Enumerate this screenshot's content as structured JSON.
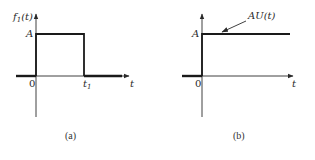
{
  "figure": {
    "panels": [
      {
        "id": "a",
        "caption": "(a)",
        "y_label_main": "f",
        "y_label_sub": "1",
        "y_label_arg": "(t)",
        "x_label": "t",
        "origin_label": "0",
        "amplitude_label": "A",
        "pulse_end_label_main": "t",
        "pulse_end_label_sub": "1",
        "signal": "rectangular pulse of height A from 0 to t1"
      },
      {
        "id": "b",
        "caption": "(b)",
        "x_label": "t",
        "origin_label": "0",
        "amplitude_label": "A",
        "annotation": "AU(t)",
        "signal": "step of height A starting at 0"
      }
    ],
    "colors": {
      "ink": "#1a1a1a",
      "background": "#ffffff"
    }
  }
}
